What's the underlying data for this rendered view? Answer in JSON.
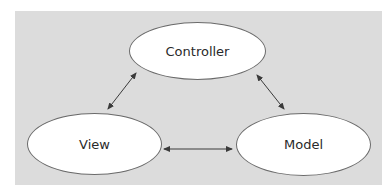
{
  "diagram": {
    "title": "",
    "colors": {
      "background": "#dcdcdc",
      "node_fill": "#ffffff",
      "node_border": "#6a6a6a",
      "text": "#2a2a2a",
      "arrow": "#3a3a3a"
    },
    "nodes": [
      {
        "id": "controller",
        "label": "Controller"
      },
      {
        "id": "view",
        "label": "View"
      },
      {
        "id": "model",
        "label": "Model"
      }
    ],
    "edges": [
      {
        "from": "view",
        "to": "controller",
        "direction": "bidirectional"
      },
      {
        "from": "controller",
        "to": "model",
        "direction": "bidirectional"
      },
      {
        "from": "view",
        "to": "model",
        "direction": "bidirectional"
      }
    ]
  }
}
